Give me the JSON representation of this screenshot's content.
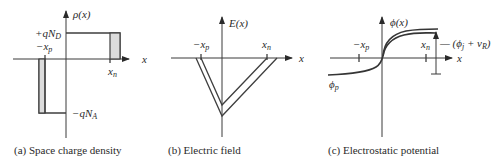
{
  "figure": {
    "panels": [
      {
        "id": "a",
        "caption": "(a) Space charge density",
        "y_label": "ρ(x)",
        "x_label": "x",
        "annotations": {
          "pos_level": "+qN",
          "pos_level_sub": "D",
          "neg_level": "−qN",
          "neg_level_sub": "A",
          "left_edge": "−x",
          "left_edge_sub": "p",
          "right_edge": "x",
          "right_edge_sub": "n"
        }
      },
      {
        "id": "b",
        "caption": "(b) Electric field",
        "y_label": "E(x)",
        "x_label": "x",
        "annotations": {
          "left_edge": "−x",
          "left_edge_sub": "p",
          "right_edge": "x",
          "right_edge_sub": "n"
        }
      },
      {
        "id": "c",
        "caption": "(c) Electrostatic potential",
        "y_label": "ϕ(x)",
        "x_label": "x",
        "annotations": {
          "left_edge": "−x",
          "left_edge_sub": "p",
          "right_edge": "x",
          "right_edge_sub": "n",
          "left_level": "ϕ",
          "left_level_sub": "p",
          "step_label_pre": "— (ϕ",
          "step_label_sub1": "j",
          "step_label_mid": " + v",
          "step_label_sub2": "R",
          "step_label_post": ")"
        }
      }
    ]
  }
}
